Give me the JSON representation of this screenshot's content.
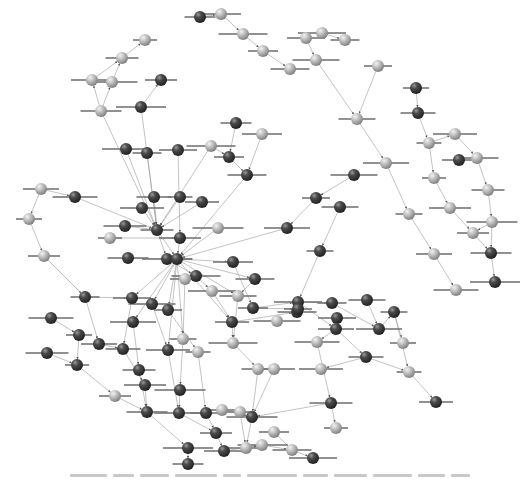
{
  "diagram": {
    "type": "network",
    "colors": {
      "dark_node": "#3a3a3a",
      "light_node": "#b5b5b5",
      "edge": "#9a9a9a",
      "background": "#ffffff"
    },
    "caption_legible": false,
    "nodes": [
      {
        "id": "n1",
        "x": 145,
        "y": 40,
        "tone": "light"
      },
      {
        "id": "n2",
        "x": 122,
        "y": 58,
        "tone": "light"
      },
      {
        "id": "n3",
        "x": 92,
        "y": 80,
        "tone": "light"
      },
      {
        "id": "n4",
        "x": 112,
        "y": 82,
        "tone": "light"
      },
      {
        "id": "n5",
        "x": 161,
        "y": 80,
        "tone": "dark"
      },
      {
        "id": "n6",
        "x": 101,
        "y": 111,
        "tone": "light"
      },
      {
        "id": "n7",
        "x": 141,
        "y": 107,
        "tone": "dark"
      },
      {
        "id": "n8",
        "x": 200,
        "y": 17,
        "tone": "dark"
      },
      {
        "id": "n9",
        "x": 221,
        "y": 14,
        "tone": "light"
      },
      {
        "id": "n10",
        "x": 243,
        "y": 34,
        "tone": "light"
      },
      {
        "id": "n11",
        "x": 263,
        "y": 51,
        "tone": "light"
      },
      {
        "id": "n12",
        "x": 290,
        "y": 69,
        "tone": "light"
      },
      {
        "id": "n13",
        "x": 322,
        "y": 33,
        "tone": "light"
      },
      {
        "id": "n14",
        "x": 345,
        "y": 40,
        "tone": "light"
      },
      {
        "id": "n15",
        "x": 306,
        "y": 38,
        "tone": "light"
      },
      {
        "id": "n16",
        "x": 316,
        "y": 60,
        "tone": "light"
      },
      {
        "id": "n17",
        "x": 378,
        "y": 66,
        "tone": "light"
      },
      {
        "id": "n18",
        "x": 357,
        "y": 119,
        "tone": "light"
      },
      {
        "id": "n19",
        "x": 386,
        "y": 163,
        "tone": "light"
      },
      {
        "id": "n20",
        "x": 409,
        "y": 214,
        "tone": "light"
      },
      {
        "id": "n21",
        "x": 434,
        "y": 254,
        "tone": "light"
      },
      {
        "id": "n22",
        "x": 456,
        "y": 290,
        "tone": "light"
      },
      {
        "id": "n23",
        "x": 416,
        "y": 88,
        "tone": "dark"
      },
      {
        "id": "n24",
        "x": 418,
        "y": 113,
        "tone": "dark"
      },
      {
        "id": "n25",
        "x": 455,
        "y": 134,
        "tone": "light"
      },
      {
        "id": "n26",
        "x": 429,
        "y": 143,
        "tone": "light"
      },
      {
        "id": "n27",
        "x": 459,
        "y": 160,
        "tone": "dark"
      },
      {
        "id": "n28",
        "x": 477,
        "y": 158,
        "tone": "light"
      },
      {
        "id": "n29",
        "x": 434,
        "y": 178,
        "tone": "light"
      },
      {
        "id": "n30",
        "x": 488,
        "y": 190,
        "tone": "light"
      },
      {
        "id": "n31",
        "x": 450,
        "y": 208,
        "tone": "light"
      },
      {
        "id": "n32",
        "x": 492,
        "y": 222,
        "tone": "light"
      },
      {
        "id": "n33",
        "x": 473,
        "y": 233,
        "tone": "light"
      },
      {
        "id": "n34",
        "x": 491,
        "y": 253,
        "tone": "dark"
      },
      {
        "id": "n35",
        "x": 495,
        "y": 282,
        "tone": "dark"
      },
      {
        "id": "n36",
        "x": 236,
        "y": 123,
        "tone": "dark"
      },
      {
        "id": "n37",
        "x": 262,
        "y": 134,
        "tone": "light"
      },
      {
        "id": "n38",
        "x": 211,
        "y": 146,
        "tone": "light"
      },
      {
        "id": "n39",
        "x": 229,
        "y": 157,
        "tone": "dark"
      },
      {
        "id": "n40",
        "x": 247,
        "y": 175,
        "tone": "dark"
      },
      {
        "id": "n41",
        "x": 126,
        "y": 149,
        "tone": "dark"
      },
      {
        "id": "n42",
        "x": 147,
        "y": 153,
        "tone": "dark"
      },
      {
        "id": "n43",
        "x": 178,
        "y": 150,
        "tone": "dark"
      },
      {
        "id": "n44",
        "x": 354,
        "y": 175,
        "tone": "dark"
      },
      {
        "id": "n45",
        "x": 316,
        "y": 198,
        "tone": "dark"
      },
      {
        "id": "n46",
        "x": 340,
        "y": 207,
        "tone": "dark"
      },
      {
        "id": "n47",
        "x": 287,
        "y": 228,
        "tone": "dark"
      },
      {
        "id": "n48",
        "x": 320,
        "y": 251,
        "tone": "dark"
      },
      {
        "id": "n49",
        "x": 41,
        "y": 189,
        "tone": "light"
      },
      {
        "id": "n50",
        "x": 75,
        "y": 197,
        "tone": "dark"
      },
      {
        "id": "n51",
        "x": 29,
        "y": 219,
        "tone": "light"
      },
      {
        "id": "n52",
        "x": 154,
        "y": 197,
        "tone": "dark"
      },
      {
        "id": "n53",
        "x": 142,
        "y": 208,
        "tone": "dark"
      },
      {
        "id": "n54",
        "x": 180,
        "y": 197,
        "tone": "dark"
      },
      {
        "id": "n55",
        "x": 202,
        "y": 202,
        "tone": "dark"
      },
      {
        "id": "n56",
        "x": 125,
        "y": 226,
        "tone": "dark"
      },
      {
        "id": "n57",
        "x": 110,
        "y": 238,
        "tone": "light"
      },
      {
        "id": "n58",
        "x": 157,
        "y": 230,
        "tone": "dark"
      },
      {
        "id": "n59",
        "x": 180,
        "y": 238,
        "tone": "dark"
      },
      {
        "id": "n60",
        "x": 218,
        "y": 228,
        "tone": "light"
      },
      {
        "id": "n61",
        "x": 44,
        "y": 256,
        "tone": "light"
      },
      {
        "id": "n62",
        "x": 128,
        "y": 258,
        "tone": "dark"
      },
      {
        "id": "n63",
        "x": 167,
        "y": 259,
        "tone": "dark"
      },
      {
        "id": "n64",
        "x": 177,
        "y": 259,
        "tone": "dark"
      },
      {
        "id": "n65",
        "x": 233,
        "y": 262,
        "tone": "dark"
      },
      {
        "id": "n66",
        "x": 196,
        "y": 276,
        "tone": "dark"
      },
      {
        "id": "n67",
        "x": 185,
        "y": 279,
        "tone": "light"
      },
      {
        "id": "n68",
        "x": 255,
        "y": 279,
        "tone": "dark"
      },
      {
        "id": "n69",
        "x": 212,
        "y": 291,
        "tone": "light"
      },
      {
        "id": "n70",
        "x": 85,
        "y": 297,
        "tone": "dark"
      },
      {
        "id": "n71",
        "x": 132,
        "y": 298,
        "tone": "dark"
      },
      {
        "id": "n72",
        "x": 152,
        "y": 304,
        "tone": "dark"
      },
      {
        "id": "n73",
        "x": 168,
        "y": 310,
        "tone": "dark"
      },
      {
        "id": "n74",
        "x": 238,
        "y": 296,
        "tone": "light"
      },
      {
        "id": "n75",
        "x": 133,
        "y": 322,
        "tone": "dark"
      },
      {
        "id": "n76",
        "x": 183,
        "y": 339,
        "tone": "light"
      },
      {
        "id": "n77",
        "x": 99,
        "y": 344,
        "tone": "dark"
      },
      {
        "id": "n78",
        "x": 51,
        "y": 318,
        "tone": "dark"
      },
      {
        "id": "n79",
        "x": 79,
        "y": 335,
        "tone": "dark"
      },
      {
        "id": "n80",
        "x": 123,
        "y": 349,
        "tone": "dark"
      },
      {
        "id": "n81",
        "x": 168,
        "y": 350,
        "tone": "dark"
      },
      {
        "id": "n82",
        "x": 198,
        "y": 352,
        "tone": "light"
      },
      {
        "id": "n83",
        "x": 232,
        "y": 322,
        "tone": "dark"
      },
      {
        "id": "n84",
        "x": 47,
        "y": 353,
        "tone": "dark"
      },
      {
        "id": "n85",
        "x": 77,
        "y": 365,
        "tone": "dark"
      },
      {
        "id": "n86",
        "x": 139,
        "y": 370,
        "tone": "dark"
      },
      {
        "id": "n87",
        "x": 145,
        "y": 385,
        "tone": "dark"
      },
      {
        "id": "n88",
        "x": 180,
        "y": 390,
        "tone": "dark"
      },
      {
        "id": "n89",
        "x": 115,
        "y": 396,
        "tone": "light"
      },
      {
        "id": "n90",
        "x": 147,
        "y": 412,
        "tone": "dark"
      },
      {
        "id": "n91",
        "x": 179,
        "y": 413,
        "tone": "dark"
      },
      {
        "id": "n92",
        "x": 206,
        "y": 413,
        "tone": "dark"
      },
      {
        "id": "n93",
        "x": 222,
        "y": 410,
        "tone": "light"
      },
      {
        "id": "n94",
        "x": 233,
        "y": 343,
        "tone": "light"
      },
      {
        "id": "n95",
        "x": 253,
        "y": 308,
        "tone": "dark"
      },
      {
        "id": "n96",
        "x": 297,
        "y": 312,
        "tone": "dark"
      },
      {
        "id": "n97",
        "x": 298,
        "y": 302,
        "tone": "dark"
      },
      {
        "id": "n98",
        "x": 332,
        "y": 303,
        "tone": "dark"
      },
      {
        "id": "n99",
        "x": 337,
        "y": 318,
        "tone": "dark"
      },
      {
        "id": "n100",
        "x": 277,
        "y": 321,
        "tone": "light"
      },
      {
        "id": "n101",
        "x": 298,
        "y": 309,
        "tone": "dark"
      },
      {
        "id": "n102",
        "x:": 0,
        "x": 367,
        "y": 300,
        "tone": "dark"
      },
      {
        "id": "n103",
        "x": 379,
        "y": 329,
        "tone": "dark"
      },
      {
        "id": "n104",
        "x": 394,
        "y": 312,
        "tone": "dark"
      },
      {
        "id": "n105",
        "x": 336,
        "y": 329,
        "tone": "dark"
      },
      {
        "id": "n106",
        "x": 317,
        "y": 342,
        "tone": "light"
      },
      {
        "id": "n107",
        "x": 403,
        "y": 343,
        "tone": "light"
      },
      {
        "id": "n108",
        "x": 366,
        "y": 357,
        "tone": "dark"
      },
      {
        "id": "n109",
        "x": 321,
        "y": 369,
        "tone": "light"
      },
      {
        "id": "n110",
        "x": 409,
        "y": 372,
        "tone": "light"
      },
      {
        "id": "n111",
        "x": 436,
        "y": 402,
        "tone": "dark"
      },
      {
        "id": "n112",
        "x": 331,
        "y": 403,
        "tone": "dark"
      },
      {
        "id": "n113",
        "x": 336,
        "y": 428,
        "tone": "light"
      },
      {
        "id": "n114",
        "x": 258,
        "y": 369,
        "tone": "light"
      },
      {
        "id": "n115",
        "x": 274,
        "y": 369,
        "tone": "light"
      },
      {
        "id": "n116",
        "x": 252,
        "y": 417,
        "tone": "dark"
      },
      {
        "id": "n117",
        "x": 216,
        "y": 433,
        "tone": "dark"
      },
      {
        "id": "n118",
        "x": 246,
        "y": 448,
        "tone": "light"
      },
      {
        "id": "n119",
        "x": 188,
        "y": 448,
        "tone": "dark"
      },
      {
        "id": "n120",
        "x": 188,
        "y": 464,
        "tone": "dark"
      },
      {
        "id": "n121",
        "x": 224,
        "y": 451,
        "tone": "dark"
      },
      {
        "id": "n122",
        "x": 262,
        "y": 445,
        "tone": "light"
      },
      {
        "id": "n123",
        "x": 274,
        "y": 432,
        "tone": "light"
      },
      {
        "id": "n124",
        "x": 292,
        "y": 450,
        "tone": "light"
      },
      {
        "id": "n125",
        "x": 313,
        "y": 458,
        "tone": "dark"
      },
      {
        "id": "n126",
        "x": 240,
        "y": 412,
        "tone": "light"
      }
    ],
    "edges": [
      [
        "n2",
        "n1"
      ],
      [
        "n3",
        "n2"
      ],
      [
        "n4",
        "n2"
      ],
      [
        "n6",
        "n3"
      ],
      [
        "n6",
        "n4"
      ],
      [
        "n7",
        "n5"
      ],
      [
        "n8",
        "n9"
      ],
      [
        "n9",
        "n10"
      ],
      [
        "n10",
        "n11"
      ],
      [
        "n11",
        "n12"
      ],
      [
        "n13",
        "n14"
      ],
      [
        "n15",
        "n16"
      ],
      [
        "n16",
        "n18"
      ],
      [
        "n17",
        "n18"
      ],
      [
        "n18",
        "n19"
      ],
      [
        "n19",
        "n20"
      ],
      [
        "n20",
        "n21"
      ],
      [
        "n21",
        "n22"
      ],
      [
        "n23",
        "n24"
      ],
      [
        "n24",
        "n26"
      ],
      [
        "n26",
        "n25"
      ],
      [
        "n25",
        "n28"
      ],
      [
        "n26",
        "n29"
      ],
      [
        "n29",
        "n31"
      ],
      [
        "n28",
        "n30"
      ],
      [
        "n30",
        "n32"
      ],
      [
        "n31",
        "n33"
      ],
      [
        "n32",
        "n33"
      ],
      [
        "n32",
        "n34"
      ],
      [
        "n33",
        "n34"
      ],
      [
        "n34",
        "n35"
      ],
      [
        "n6",
        "n58"
      ],
      [
        "n7",
        "n58"
      ],
      [
        "n36",
        "n39"
      ],
      [
        "n37",
        "n40"
      ],
      [
        "n38",
        "n39"
      ],
      [
        "n39",
        "n40"
      ],
      [
        "n38",
        "n58"
      ],
      [
        "n40",
        "n64"
      ],
      [
        "n41",
        "n58"
      ],
      [
        "n42",
        "n58"
      ],
      [
        "n43",
        "n59"
      ],
      [
        "n44",
        "n45"
      ],
      [
        "n45",
        "n47"
      ],
      [
        "n46",
        "n48"
      ],
      [
        "n47",
        "n64"
      ],
      [
        "n48",
        "n97"
      ],
      [
        "n49",
        "n50"
      ],
      [
        "n49",
        "n51"
      ],
      [
        "n51",
        "n61"
      ],
      [
        "n61",
        "n70"
      ],
      [
        "n50",
        "n58"
      ],
      [
        "n52",
        "n58"
      ],
      [
        "n53",
        "n58"
      ],
      [
        "n54",
        "n58"
      ],
      [
        "n55",
        "n58"
      ],
      [
        "n56",
        "n58"
      ],
      [
        "n57",
        "n59"
      ],
      [
        "n58",
        "n63"
      ],
      [
        "n58",
        "n64"
      ],
      [
        "n59",
        "n64"
      ],
      [
        "n60",
        "n64"
      ],
      [
        "n62",
        "n64"
      ],
      [
        "n63",
        "n66"
      ],
      [
        "n64",
        "n65"
      ],
      [
        "n64",
        "n68"
      ],
      [
        "n64",
        "n74"
      ],
      [
        "n64",
        "n83"
      ],
      [
        "n64",
        "n71"
      ],
      [
        "n64",
        "n72"
      ],
      [
        "n64",
        "n73"
      ],
      [
        "n64",
        "n75"
      ],
      [
        "n64",
        "n76"
      ],
      [
        "n64",
        "n81"
      ],
      [
        "n65",
        "n95"
      ],
      [
        "n66",
        "n69"
      ],
      [
        "n67",
        "n76"
      ],
      [
        "n68",
        "n74"
      ],
      [
        "n69",
        "n83"
      ],
      [
        "n70",
        "n77"
      ],
      [
        "n70",
        "n71"
      ],
      [
        "n71",
        "n80"
      ],
      [
        "n72",
        "n81"
      ],
      [
        "n73",
        "n82"
      ],
      [
        "n74",
        "n94"
      ],
      [
        "n75",
        "n86"
      ],
      [
        "n76",
        "n88"
      ],
      [
        "n77",
        "n80"
      ],
      [
        "n78",
        "n79"
      ],
      [
        "n79",
        "n85"
      ],
      [
        "n80",
        "n87"
      ],
      [
        "n81",
        "n91"
      ],
      [
        "n82",
        "n92"
      ],
      [
        "n83",
        "n94"
      ],
      [
        "n83",
        "n96"
      ],
      [
        "n84",
        "n85"
      ],
      [
        "n85",
        "n89"
      ],
      [
        "n86",
        "n90"
      ],
      [
        "n87",
        "n90"
      ],
      [
        "n88",
        "n91"
      ],
      [
        "n89",
        "n90"
      ],
      [
        "n90",
        "n119"
      ],
      [
        "n91",
        "n117"
      ],
      [
        "n92",
        "n117"
      ],
      [
        "n93",
        "n116"
      ],
      [
        "n94",
        "n114"
      ],
      [
        "n95",
        "n97"
      ],
      [
        "n95",
        "n101"
      ],
      [
        "n97",
        "n98"
      ],
      [
        "n97",
        "n105"
      ],
      [
        "n98",
        "n103"
      ],
      [
        "n102",
        "n103"
      ],
      [
        "n103",
        "n104"
      ],
      [
        "n104",
        "n107"
      ],
      [
        "n104",
        "n110"
      ],
      [
        "n105",
        "n106"
      ],
      [
        "n105",
        "n108"
      ],
      [
        "n106",
        "n112"
      ],
      [
        "n108",
        "n110"
      ],
      [
        "n108",
        "n109"
      ],
      [
        "n110",
        "n111"
      ],
      [
        "n112",
        "n113"
      ],
      [
        "n112",
        "n116"
      ],
      [
        "n114",
        "n116"
      ],
      [
        "n115",
        "n116"
      ],
      [
        "n116",
        "n118"
      ],
      [
        "n117",
        "n121"
      ],
      [
        "n119",
        "n120"
      ],
      [
        "n121",
        "n122"
      ],
      [
        "n122",
        "n124"
      ],
      [
        "n123",
        "n124"
      ],
      [
        "n124",
        "n125"
      ],
      [
        "n118",
        "n122"
      ],
      [
        "n126",
        "n118"
      ]
    ]
  }
}
